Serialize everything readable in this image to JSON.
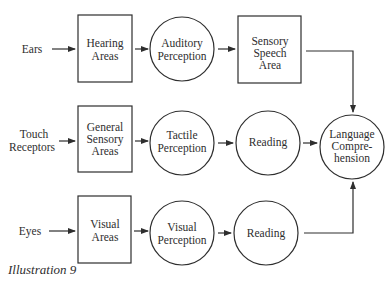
{
  "diagram": {
    "caption": "Illustration 9",
    "inputs": [
      {
        "id": "ears",
        "lines": [
          "Ears"
        ]
      },
      {
        "id": "touch",
        "lines": [
          "Touch",
          "Receptors"
        ]
      },
      {
        "id": "eyes",
        "lines": [
          "Eyes"
        ]
      }
    ],
    "nodes": [
      {
        "id": "hearing-areas",
        "shape": "rect",
        "lines": [
          "Hearing",
          "Areas"
        ]
      },
      {
        "id": "auditory-perception",
        "shape": "circle",
        "lines": [
          "Auditory",
          "Perception"
        ]
      },
      {
        "id": "sensory-speech-area",
        "shape": "rect",
        "lines": [
          "Sensory",
          "Speech",
          "Area"
        ]
      },
      {
        "id": "general-sensory-areas",
        "shape": "rect",
        "lines": [
          "General",
          "Sensory",
          "Areas"
        ]
      },
      {
        "id": "tactile-perception",
        "shape": "circle",
        "lines": [
          "Tactile",
          "Perception"
        ]
      },
      {
        "id": "reading-tactile",
        "shape": "circle",
        "lines": [
          "Reading"
        ]
      },
      {
        "id": "language-comprehension",
        "shape": "circle",
        "lines": [
          "Language",
          "Compre-",
          "hension"
        ]
      },
      {
        "id": "visual-areas",
        "shape": "rect",
        "lines": [
          "Visual",
          "Areas"
        ]
      },
      {
        "id": "visual-perception",
        "shape": "circle",
        "lines": [
          "Visual",
          "Perception"
        ]
      },
      {
        "id": "reading-visual",
        "shape": "circle",
        "lines": [
          "Reading"
        ]
      }
    ],
    "edges": [
      [
        "ears",
        "hearing-areas"
      ],
      [
        "hearing-areas",
        "auditory-perception"
      ],
      [
        "auditory-perception",
        "sensory-speech-area"
      ],
      [
        "sensory-speech-area",
        "language-comprehension"
      ],
      [
        "touch",
        "general-sensory-areas"
      ],
      [
        "general-sensory-areas",
        "tactile-perception"
      ],
      [
        "tactile-perception",
        "reading-tactile"
      ],
      [
        "reading-tactile",
        "language-comprehension"
      ],
      [
        "eyes",
        "visual-areas"
      ],
      [
        "visual-areas",
        "visual-perception"
      ],
      [
        "visual-perception",
        "reading-visual"
      ],
      [
        "reading-visual",
        "language-comprehension"
      ]
    ],
    "colors": {
      "stroke": "#2e2e2e",
      "background": "#ffffff"
    }
  }
}
